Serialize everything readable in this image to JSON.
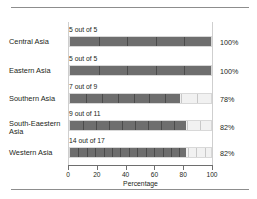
{
  "chart_data": {
    "type": "bar",
    "title": "",
    "subtitle": "",
    "xlabel": "Percentage",
    "ylabel": "",
    "xlim": [
      0,
      100
    ],
    "xticks": [
      0,
      20,
      40,
      60,
      80,
      100
    ],
    "grid": false,
    "legend": null,
    "orientation": "horizontal",
    "categories": [
      "Central Asia",
      "Eastern Asia",
      "Southern Asia",
      "South-Eaestern Asia",
      "Western Asia"
    ],
    "values": [
      100,
      100,
      78,
      82,
      82
    ],
    "value_labels": [
      "100%",
      "100%",
      "78%",
      "82%",
      "82%"
    ],
    "annotations": [
      "5 out of 5",
      "5 out of 5",
      "7 out of 9",
      "9 out of 11",
      "14 out of 17"
    ],
    "counts": [
      {
        "numerator": 5,
        "denominator": 5
      },
      {
        "numerator": 5,
        "denominator": 5
      },
      {
        "numerator": 7,
        "denominator": 9
      },
      {
        "numerator": 9,
        "denominator": 11
      },
      {
        "numerator": 14,
        "denominator": 17
      }
    ],
    "colors": {
      "fill": "#6e6e6e",
      "empty": "#f1f1f1",
      "segment_divider": "#2f2f2f",
      "axis": "#6e6e6e",
      "rule": "#8d8d8d",
      "text": "#231f20"
    }
  },
  "rows": [
    {
      "label": "Central Asia",
      "annotation": "5 out of 5",
      "percent_label": "100%",
      "percent": 100,
      "segments": 5,
      "filled": 5
    },
    {
      "label": "Eastern Asia",
      "annotation": "5 out of 5",
      "percent_label": "100%",
      "percent": 100,
      "segments": 5,
      "filled": 5
    },
    {
      "label": "Southern Asia",
      "annotation": "7 out of 9",
      "percent_label": "78%",
      "percent": 78,
      "segments": 9,
      "filled": 7
    },
    {
      "label": "South-Eaestern Asia",
      "annotation": "9 out of 11",
      "percent_label": "82%",
      "percent": 82,
      "segments": 11,
      "filled": 9
    },
    {
      "label": "Western Asia",
      "annotation": "14 out of 17",
      "percent_label": "82%",
      "percent": 82,
      "segments": 17,
      "filled": 14
    }
  ],
  "axis": {
    "title": "Percentage",
    "ticks": [
      "0",
      "20",
      "40",
      "60",
      "80",
      "100"
    ]
  }
}
